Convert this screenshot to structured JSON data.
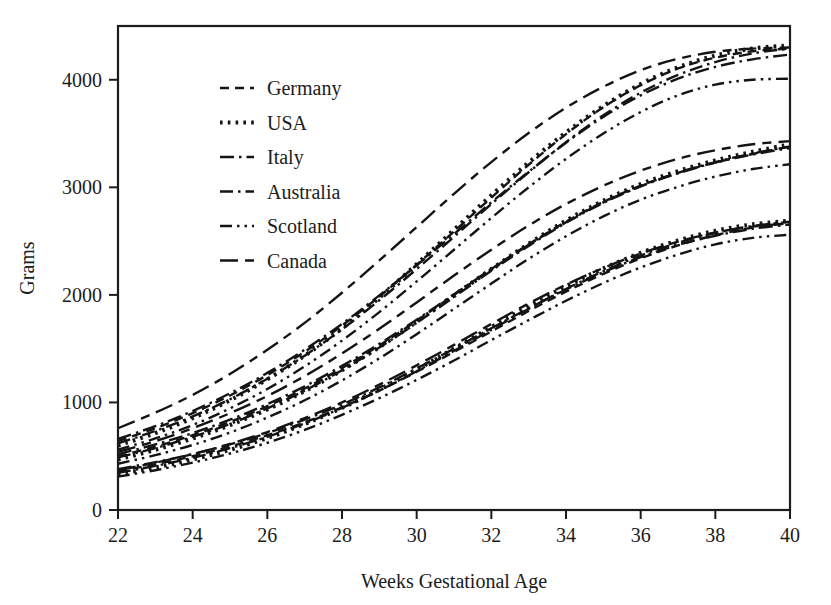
{
  "chart_data": {
    "type": "line",
    "title": "",
    "xlabel": "Weeks Gestational Age",
    "ylabel": "Grams",
    "xlim": [
      22,
      40
    ],
    "ylim": [
      0,
      4500
    ],
    "xticks": [
      22,
      24,
      26,
      28,
      30,
      32,
      34,
      36,
      38,
      40
    ],
    "yticks": [
      0,
      1000,
      2000,
      3000,
      4000
    ],
    "grid": false,
    "legend_position": "upper-left-inside",
    "x": [
      22,
      23,
      24,
      25,
      26,
      27,
      28,
      29,
      30,
      31,
      32,
      33,
      34,
      35,
      36,
      37,
      38,
      39,
      40
    ],
    "bands": [
      "90th percentile",
      "50th percentile",
      "10th percentile"
    ],
    "series": [
      {
        "name": "Germany",
        "dash": "dashed",
        "dasharray": "9,6",
        "width": 2.4,
        "bands": {
          "90th percentile": [
            640,
            760,
            900,
            1065,
            1255,
            1470,
            1715,
            1985,
            2280,
            2590,
            2905,
            3210,
            3495,
            3745,
            3950,
            4105,
            4205,
            4265,
            4290
          ],
          "50th percentile": [
            500,
            590,
            695,
            820,
            965,
            1130,
            1320,
            1530,
            1760,
            2000,
            2240,
            2470,
            2680,
            2865,
            3015,
            3135,
            3230,
            3310,
            3380
          ],
          "10th percentile": [
            360,
            425,
            500,
            590,
            695,
            815,
            955,
            1110,
            1285,
            1470,
            1660,
            1850,
            2030,
            2195,
            2340,
            2460,
            2555,
            2625,
            2670
          ]
        }
      },
      {
        "name": "USA",
        "dash": "dotted",
        "dasharray": "2.6,5.2",
        "width": 4.2,
        "bands": {
          "90th percentile": [
            600,
            715,
            855,
            1020,
            1215,
            1435,
            1690,
            1975,
            2285,
            2605,
            2925,
            3230,
            3510,
            3755,
            3960,
            4115,
            4225,
            4290,
            4320
          ],
          "50th percentile": [
            470,
            560,
            665,
            790,
            935,
            1105,
            1300,
            1515,
            1750,
            1995,
            2240,
            2475,
            2690,
            2875,
            3030,
            3150,
            3250,
            3330,
            3400
          ],
          "10th percentile": [
            330,
            395,
            470,
            560,
            670,
            800,
            950,
            1120,
            1305,
            1500,
            1700,
            1895,
            2080,
            2245,
            2390,
            2505,
            2595,
            2655,
            2690
          ]
        }
      },
      {
        "name": "Italy",
        "dash": "dash-dot",
        "dasharray": "14,5,2.5,5",
        "width": 2.4,
        "bands": {
          "90th percentile": [
            660,
            780,
            920,
            1085,
            1275,
            1490,
            1730,
            1995,
            2275,
            2565,
            2860,
            3145,
            3415,
            3655,
            3855,
            4010,
            4120,
            4190,
            4235
          ],
          "50th percentile": [
            520,
            610,
            715,
            840,
            985,
            1150,
            1340,
            1545,
            1770,
            2005,
            2240,
            2465,
            2675,
            2860,
            3010,
            3130,
            3230,
            3305,
            3365
          ],
          "10th percentile": [
            380,
            445,
            520,
            610,
            715,
            840,
            980,
            1140,
            1315,
            1500,
            1690,
            1875,
            2050,
            2210,
            2350,
            2465,
            2550,
            2615,
            2655
          ]
        }
      },
      {
        "name": "Australia",
        "dash": "dash-dot",
        "dasharray": "13,5,2.5,5",
        "width": 2.4,
        "bands": {
          "90th percentile": [
            620,
            735,
            870,
            1030,
            1220,
            1435,
            1680,
            1950,
            2240,
            2540,
            2845,
            3140,
            3420,
            3670,
            3880,
            4045,
            4165,
            4245,
            4290
          ],
          "50th percentile": [
            490,
            575,
            680,
            800,
            945,
            1110,
            1300,
            1510,
            1740,
            1980,
            2225,
            2455,
            2670,
            2855,
            3010,
            3135,
            3235,
            3315,
            3380
          ],
          "10th percentile": [
            345,
            410,
            485,
            575,
            680,
            805,
            950,
            1110,
            1290,
            1480,
            1675,
            1870,
            2055,
            2220,
            2365,
            2485,
            2575,
            2640,
            2680
          ]
        }
      },
      {
        "name": "Scotland",
        "dash": "dash-dot-dot",
        "dasharray": "12,5,2.5,5,2.5,5",
        "width": 2.4,
        "bands": {
          "90th percentile": [
            560,
            665,
            790,
            945,
            1125,
            1335,
            1575,
            1840,
            2125,
            2420,
            2715,
            3000,
            3265,
            3500,
            3700,
            3855,
            3955,
            4000,
            4010
          ],
          "50th percentile": [
            430,
            510,
            605,
            720,
            860,
            1020,
            1205,
            1410,
            1635,
            1870,
            2105,
            2335,
            2545,
            2730,
            2885,
            3005,
            3100,
            3170,
            3215
          ],
          "10th percentile": [
            310,
            370,
            440,
            525,
            625,
            745,
            885,
            1040,
            1210,
            1390,
            1580,
            1765,
            1945,
            2110,
            2255,
            2375,
            2470,
            2530,
            2560
          ]
        }
      },
      {
        "name": "Canada",
        "dash": "long-dash",
        "dasharray": "18,7,9,7",
        "width": 2.4,
        "bands": {
          "90th percentile": [
            760,
            905,
            1070,
            1265,
            1490,
            1740,
            2020,
            2320,
            2630,
            2940,
            3235,
            3505,
            3740,
            3935,
            4090,
            4195,
            4260,
            4290,
            4300
          ],
          "50th percentile": [
            540,
            640,
            760,
            900,
            1060,
            1245,
            1455,
            1685,
            1930,
            2180,
            2420,
            2645,
            2845,
            3015,
            3155,
            3265,
            3345,
            3400,
            3430
          ],
          "10th percentile": [
            370,
            440,
            520,
            615,
            725,
            855,
            1000,
            1165,
            1345,
            1535,
            1730,
            1920,
            2095,
            2250,
            2385,
            2495,
            2580,
            2635,
            2665
          ]
        }
      }
    ]
  },
  "axes": {
    "y_title": "Grams",
    "x_title": "Weeks Gestational Age",
    "y_tick_labels": [
      "4000",
      "3000",
      "2000",
      "1000",
      "0"
    ],
    "x_tick_labels": [
      "22",
      "24",
      "26",
      "28",
      "30",
      "32",
      "34",
      "36",
      "38",
      "40"
    ]
  },
  "legend": {
    "items": [
      {
        "label": "Germany"
      },
      {
        "label": "USA"
      },
      {
        "label": "Italy"
      },
      {
        "label": "Australia"
      },
      {
        "label": "Scotland"
      },
      {
        "label": "Canada"
      }
    ]
  },
  "colors": {
    "ink": "#141414",
    "background": "#ffffff",
    "axis": "#1c1c1c"
  }
}
